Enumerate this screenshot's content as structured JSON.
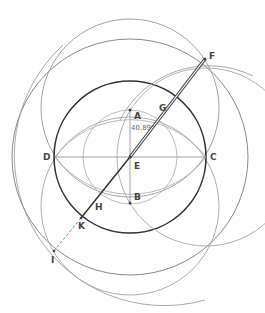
{
  "diagram": {
    "title": "",
    "points": [
      {
        "name": "A",
        "x": 130,
        "y": 110,
        "label_x": 134,
        "label_y": 112
      },
      {
        "name": "B",
        "x": 130,
        "y": 203,
        "label_x": 134,
        "label_y": 193
      },
      {
        "name": "C",
        "x": 206,
        "y": 157,
        "label_x": 210,
        "label_y": 153
      },
      {
        "name": "D",
        "x": 55,
        "y": 157,
        "label_x": 43,
        "label_y": 153
      },
      {
        "name": "E",
        "x": 130,
        "y": 157,
        "label_x": 134,
        "label_y": 162
      },
      {
        "name": "F",
        "x": 205,
        "y": 59,
        "label_x": 209,
        "label_y": 52
      },
      {
        "name": "G",
        "x": 162,
        "y": 114,
        "label_x": 159,
        "label_y": 104
      },
      {
        "name": "H",
        "x": 98,
        "y": 200,
        "label_x": 95,
        "label_y": 203
      },
      {
        "name": "I",
        "x": 54,
        "y": 251,
        "label_x": 51,
        "label_y": 256
      },
      {
        "name": "K",
        "x": 81,
        "y": 218,
        "label_x": 78,
        "label_y": 222
      }
    ],
    "angle_annotation": {
      "text": "40,89°",
      "x": 131,
      "y": 125
    },
    "colors": {
      "dark": "#333333",
      "mid": "#888888",
      "light": "#b5b5b5"
    }
  }
}
